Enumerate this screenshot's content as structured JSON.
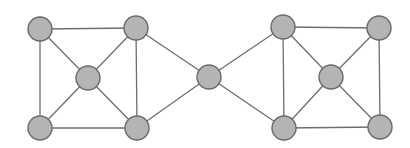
{
  "diagram": {
    "type": "undirected-graph",
    "colors": {
      "node_fill": "#b4b4b4",
      "node_stroke": "#6a6a6a",
      "edge": "#6e6e6e",
      "background": "#ffffff"
    },
    "node_radius": 12,
    "nodes": [
      {
        "id": "L-TL",
        "x": 40,
        "y": 29
      },
      {
        "id": "L-TR",
        "x": 136,
        "y": 28
      },
      {
        "id": "L-C",
        "x": 88,
        "y": 78
      },
      {
        "id": "L-BL",
        "x": 40,
        "y": 128
      },
      {
        "id": "L-BR",
        "x": 137,
        "y": 128
      },
      {
        "id": "M",
        "x": 209,
        "y": 77
      },
      {
        "id": "R-TL",
        "x": 283,
        "y": 27
      },
      {
        "id": "R-TR",
        "x": 379,
        "y": 28
      },
      {
        "id": "R-C",
        "x": 331,
        "y": 77
      },
      {
        "id": "R-BL",
        "x": 284,
        "y": 128
      },
      {
        "id": "R-BR",
        "x": 380,
        "y": 127
      }
    ],
    "edges": [
      [
        "L-TL",
        "L-TR"
      ],
      [
        "L-TL",
        "L-BL"
      ],
      [
        "L-TL",
        "L-C"
      ],
      [
        "L-TR",
        "L-C"
      ],
      [
        "L-TR",
        "L-BR"
      ],
      [
        "L-TR",
        "M"
      ],
      [
        "L-C",
        "L-BL"
      ],
      [
        "L-C",
        "L-BR"
      ],
      [
        "L-BL",
        "L-BR"
      ],
      [
        "L-BR",
        "M"
      ],
      [
        "M",
        "R-TL"
      ],
      [
        "M",
        "R-BL"
      ],
      [
        "R-TL",
        "R-TR"
      ],
      [
        "R-TL",
        "R-BL"
      ],
      [
        "R-TL",
        "R-C"
      ],
      [
        "R-TR",
        "R-C"
      ],
      [
        "R-TR",
        "R-BR"
      ],
      [
        "R-C",
        "R-BL"
      ],
      [
        "R-C",
        "R-BR"
      ],
      [
        "R-BL",
        "R-BR"
      ]
    ]
  }
}
